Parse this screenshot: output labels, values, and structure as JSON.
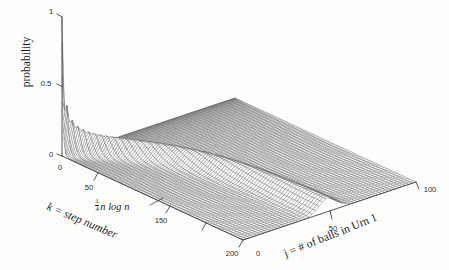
{
  "figure": {
    "background_color": "#fdfdfb",
    "ink_color": "#1d1d1d",
    "mesh_color": "#555555"
  },
  "axes": {
    "z": {
      "label": "probability",
      "ticks": [
        "1",
        "0.5",
        "0"
      ],
      "tick_values": [
        1,
        0.5,
        0
      ],
      "range": [
        0,
        1
      ]
    },
    "x": {
      "label_line1": "k = step number",
      "label_line2": "",
      "ticks": [
        "0",
        "50",
        "150",
        "200"
      ],
      "tick_values": [
        0,
        50,
        150,
        200
      ],
      "range": [
        0,
        200
      ]
    },
    "y": {
      "label": "j = # of balls in Urn 1",
      "ticks": [
        "0",
        "50",
        "100"
      ],
      "tick_values": [
        0,
        50,
        100
      ],
      "range": [
        0,
        100
      ]
    }
  },
  "annotations": [
    {
      "name": "mixing-time-annotation",
      "fraction_numerator": "1",
      "fraction_denominator": "4",
      "text": "n log n",
      "pointer": true
    }
  ],
  "chart_data": {
    "type": "line",
    "plot_style": "3d-surface-mesh",
    "title": "",
    "xlabel": "k = step number",
    "ylabel": "j = # of balls in Urn 1",
    "zlabel": "probability",
    "xlim": [
      0,
      200
    ],
    "ylim": [
      0,
      100
    ],
    "zlim": [
      0,
      1
    ],
    "grid": false,
    "legend": null,
    "annotations": [
      "1/4 n log n"
    ],
    "series": [
      {
        "name": "k=0",
        "peak_j": 0,
        "peak_probability": 1.0
      },
      {
        "name": "k=2",
        "peak_j": 2,
        "peak_probability": 0.92
      },
      {
        "name": "k=4",
        "peak_j": 4,
        "peak_probability": 0.78
      },
      {
        "name": "k=6",
        "peak_j": 6,
        "peak_probability": 0.62
      },
      {
        "name": "k=8",
        "peak_j": 8,
        "peak_probability": 0.5
      },
      {
        "name": "k=10",
        "peak_j": 10,
        "peak_probability": 0.42
      },
      {
        "name": "k=14",
        "peak_j": 13,
        "peak_probability": 0.33
      },
      {
        "name": "k=18",
        "peak_j": 17,
        "peak_probability": 0.27
      },
      {
        "name": "k=24",
        "peak_j": 22,
        "peak_probability": 0.22
      },
      {
        "name": "k=32",
        "peak_j": 28,
        "peak_probability": 0.18
      },
      {
        "name": "k=44",
        "peak_j": 35,
        "peak_probability": 0.15
      },
      {
        "name": "k=60",
        "peak_j": 42,
        "peak_probability": 0.12
      },
      {
        "name": "k=80",
        "peak_j": 46,
        "peak_probability": 0.11
      },
      {
        "name": "k=115",
        "peak_j": 49,
        "peak_probability": 0.105
      },
      {
        "name": "k=150",
        "peak_j": 50,
        "peak_probability": 0.1
      },
      {
        "name": "k=200",
        "peak_j": 50,
        "peak_probability": 0.1
      }
    ],
    "x": [
      0,
      2,
      4,
      6,
      8,
      10,
      14,
      18,
      24,
      32,
      44,
      60,
      80,
      115,
      150,
      200
    ],
    "peak_probabilities": [
      1.0,
      0.92,
      0.78,
      0.62,
      0.5,
      0.42,
      0.33,
      0.27,
      0.22,
      0.18,
      0.15,
      0.12,
      0.11,
      0.105,
      0.1,
      0.1
    ]
  }
}
